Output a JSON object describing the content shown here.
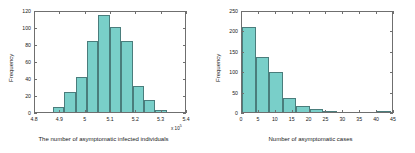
{
  "figure": {
    "background": "#ffffff",
    "bar_fill": "#79cfc9",
    "bar_edge": "#4a7d7c",
    "axis_color": "#6f6f6f"
  },
  "chart_data": [
    {
      "type": "bar",
      "panel": "left",
      "title": "",
      "xlabel": "The number of asymptomatic infected individuals",
      "ylabel": "Frequency",
      "x_exponent_label": "x 10",
      "x_exponent_power": "5",
      "xlim": [
        4.8,
        5.4
      ],
      "ylim": [
        0,
        120
      ],
      "xticks": [
        4.8,
        4.9,
        5,
        5.1,
        5.2,
        5.3,
        5.4
      ],
      "xticklabels": [
        "4.8",
        "4.9",
        "5",
        "5.1",
        "5.2",
        "5.3",
        "5.4"
      ],
      "yticks": [
        0,
        20,
        40,
        60,
        80,
        100,
        120
      ],
      "yticklabels": [
        "0",
        "20",
        "40",
        "60",
        "80",
        "100",
        "120"
      ],
      "grid": false,
      "legend": "none",
      "bin_edges": [
        4.87,
        4.915,
        4.96,
        5.005,
        5.05,
        5.095,
        5.14,
        5.185,
        5.23,
        5.275,
        5.32,
        5.365
      ],
      "values": [
        6,
        23,
        41,
        84,
        114,
        100,
        83,
        31,
        14,
        2
      ],
      "bins": [
        {
          "x0": 4.87,
          "x1": 4.915,
          "count": 6
        },
        {
          "x0": 4.915,
          "x1": 4.96,
          "count": 23
        },
        {
          "x0": 4.96,
          "x1": 5.005,
          "count": 41
        },
        {
          "x0": 5.005,
          "x1": 5.05,
          "count": 84
        },
        {
          "x0": 5.05,
          "x1": 5.095,
          "count": 114
        },
        {
          "x0": 5.095,
          "x1": 5.14,
          "count": 100
        },
        {
          "x0": 5.14,
          "x1": 5.185,
          "count": 83
        },
        {
          "x0": 5.185,
          "x1": 5.23,
          "count": 31
        },
        {
          "x0": 5.23,
          "x1": 5.275,
          "count": 14
        },
        {
          "x0": 5.275,
          "x1": 5.32,
          "count": 2
        }
      ]
    },
    {
      "type": "bar",
      "panel": "right",
      "title": "",
      "xlabel": "Number of asymptomatic cases",
      "ylabel": "Frequency",
      "xlim": [
        0,
        45
      ],
      "ylim": [
        0,
        250
      ],
      "xticks": [
        0,
        5,
        10,
        15,
        20,
        25,
        30,
        35,
        40,
        45
      ],
      "xticklabels": [
        "0",
        "5",
        "10",
        "15",
        "20",
        "25",
        "30",
        "35",
        "40",
        "45"
      ],
      "yticks": [
        0,
        50,
        100,
        150,
        200,
        250
      ],
      "yticklabels": [
        "0",
        "50",
        "100",
        "150",
        "200",
        "250"
      ],
      "grid": false,
      "legend": "none",
      "bin_edges": [
        0,
        4,
        8,
        12,
        16,
        20,
        24,
        28,
        40,
        44
      ],
      "values": [
        208,
        135,
        97,
        35,
        15,
        7,
        2,
        0,
        1
      ],
      "bins": [
        {
          "x0": 0,
          "x1": 4,
          "count": 208
        },
        {
          "x0": 4,
          "x1": 8,
          "count": 135
        },
        {
          "x0": 8,
          "x1": 12,
          "count": 97
        },
        {
          "x0": 12,
          "x1": 16,
          "count": 35
        },
        {
          "x0": 16,
          "x1": 20,
          "count": 15
        },
        {
          "x0": 20,
          "x1": 24,
          "count": 7
        },
        {
          "x0": 24,
          "x1": 28,
          "count": 2
        },
        {
          "x0": 28,
          "x1": 40,
          "count": 0
        },
        {
          "x0": 40,
          "x1": 44,
          "count": 1
        }
      ]
    }
  ]
}
